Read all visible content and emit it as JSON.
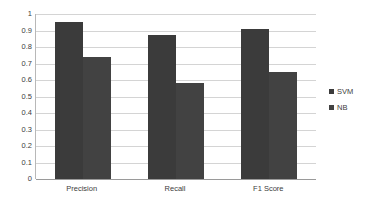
{
  "chart_data": {
    "type": "bar",
    "title": "",
    "subtitle": "",
    "xlabel": "",
    "ylabel": "",
    "categories": [
      "Precision",
      "Recall",
      "F1 Score"
    ],
    "series": [
      {
        "name": "SVM",
        "values": [
          0.95,
          0.87,
          0.91
        ],
        "color": "#3b3b3b"
      },
      {
        "name": "NB",
        "values": [
          0.74,
          0.58,
          0.65
        ],
        "color": "#424242"
      }
    ],
    "ylim": [
      0,
      1
    ],
    "ytick_labels": [
      "1",
      "0.9",
      "0.8",
      "0.7",
      "0.6",
      "0.5",
      "0.4",
      "0.3",
      "0.2",
      "0.1",
      "0"
    ],
    "ytick_values": [
      1,
      0.9,
      0.8,
      0.7,
      0.6,
      0.5,
      0.4,
      0.3,
      0.2,
      0.1,
      0
    ],
    "grid": true,
    "grid_color": "#d4d4d4",
    "axis_color": "#9a9a9a",
    "legend_position": "right",
    "background": "#ffffff"
  },
  "legend": {
    "items": [
      {
        "label": "SVM",
        "swatch": "#3b3b3b"
      },
      {
        "label": "NB",
        "swatch": "#424242"
      }
    ]
  }
}
